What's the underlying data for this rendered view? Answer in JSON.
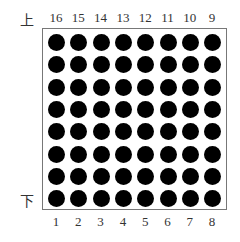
{
  "diagram": {
    "type": "8x8 LED dot matrix pinout",
    "rows": 8,
    "cols": 8,
    "labels": {
      "top_side": "上",
      "bottom_side": "下"
    },
    "top_pins": [
      "16",
      "15",
      "14",
      "13",
      "12",
      "11",
      "10",
      "9"
    ],
    "bottom_pins": [
      "1",
      "2",
      "3",
      "4",
      "5",
      "6",
      "7",
      "8"
    ],
    "dot_color": "#000000",
    "border_color": "#777777"
  }
}
